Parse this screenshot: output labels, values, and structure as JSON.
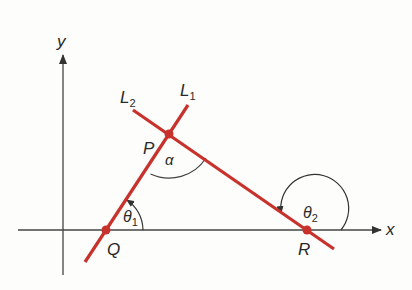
{
  "diagram": {
    "type": "geometry",
    "colors": {
      "line": "#c8322c",
      "axis": "#444444",
      "arc": "#444444",
      "text": "#2a2a2a",
      "background": "#fdfdfb"
    },
    "axes": {
      "x_label": "x",
      "y_label": "y"
    },
    "lines": [
      {
        "name": "L1",
        "label_main": "L",
        "label_sub": "1"
      },
      {
        "name": "L2",
        "label_main": "L",
        "label_sub": "2"
      }
    ],
    "points": [
      {
        "name": "P",
        "label": "P",
        "description": "intersection of L1 and L2"
      },
      {
        "name": "Q",
        "label": "Q",
        "description": "L1 meets x-axis"
      },
      {
        "name": "R",
        "label": "R",
        "description": "L2 meets x-axis"
      }
    ],
    "angles": [
      {
        "name": "alpha",
        "label": "α",
        "description": "angle between L1 and L2 at P"
      },
      {
        "name": "theta1",
        "label_main": "θ",
        "label_sub": "1",
        "description": "inclination of L1 at Q"
      },
      {
        "name": "theta2",
        "label_main": "θ",
        "label_sub": "2",
        "description": "inclination of L2 at R"
      }
    ]
  }
}
